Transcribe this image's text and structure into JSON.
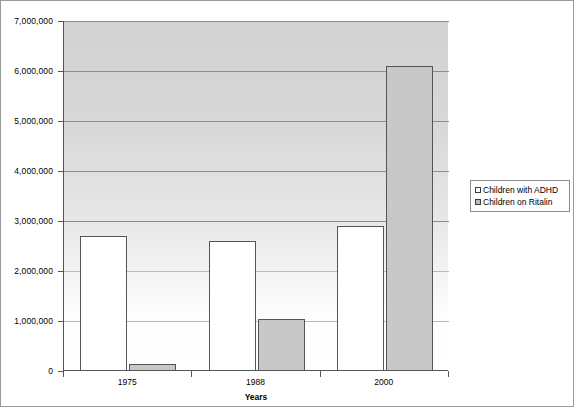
{
  "chart_data": {
    "type": "bar",
    "title": "",
    "xlabel": "Years",
    "ylabel": "",
    "categories": [
      "1975",
      "1988",
      "2000"
    ],
    "series": [
      {
        "name": "Children with ADHD",
        "color": "#ffffff",
        "values": [
          2700000,
          2600000,
          2900000
        ]
      },
      {
        "name": "Children on Ritalin",
        "color": "#c8c8c8",
        "values": [
          150000,
          1050000,
          6100000
        ]
      }
    ],
    "ylim": [
      0,
      7000000
    ],
    "ytick_values": [
      0,
      1000000,
      2000000,
      3000000,
      4000000,
      5000000,
      6000000,
      7000000
    ],
    "ytick_labels": [
      "0",
      "1,000,000",
      "2,000,000",
      "3,000,000",
      "4,000,000",
      "5,000,000",
      "6,000,000",
      "7,000,000"
    ],
    "grid": true,
    "legend_position": "right"
  },
  "legend": {
    "entries": [
      {
        "label": "Children with ADHD"
      },
      {
        "label": "Children on Ritalin"
      }
    ]
  },
  "axes": {
    "x_title": "Years"
  }
}
